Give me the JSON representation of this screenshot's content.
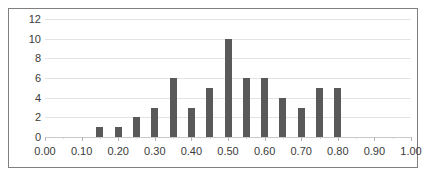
{
  "chart_data": {
    "type": "bar",
    "title": "",
    "subtitle": "",
    "xlabel": "",
    "ylabel": "",
    "xlim": [
      0.0,
      1.0
    ],
    "ylim": [
      0,
      12
    ],
    "grid": true,
    "legend": false,
    "legend_position": "none",
    "bar_color": "#595959",
    "gridline_color": "#e3e3e3",
    "axis_color": "#c9c9c9",
    "border_color": "#808080",
    "background_color": "#ffffff",
    "text_color": "#3b3b3b",
    "x_tick_labels": [
      "0.00",
      "0.10",
      "0.20",
      "0.30",
      "0.40",
      "0.50",
      "0.60",
      "0.70",
      "0.80",
      "0.90",
      "1.00"
    ],
    "x_tick_values": [
      0.0,
      0.1,
      0.2,
      0.3,
      0.4,
      0.5,
      0.6,
      0.7,
      0.8,
      0.9,
      1.0
    ],
    "y_tick_labels": [
      "12",
      "10",
      "8",
      "6",
      "4",
      "2",
      "0"
    ],
    "y_tick_values": [
      12,
      10,
      8,
      6,
      4,
      2,
      0
    ],
    "bin_width": 0.05,
    "categories": [
      0.15,
      0.2,
      0.25,
      0.3,
      0.35,
      0.4,
      0.45,
      0.5,
      0.55,
      0.6,
      0.65,
      0.7,
      0.75,
      0.8
    ],
    "values": [
      1,
      1,
      2,
      3,
      6,
      3,
      5,
      10,
      6,
      6,
      4,
      3,
      5,
      5
    ]
  }
}
